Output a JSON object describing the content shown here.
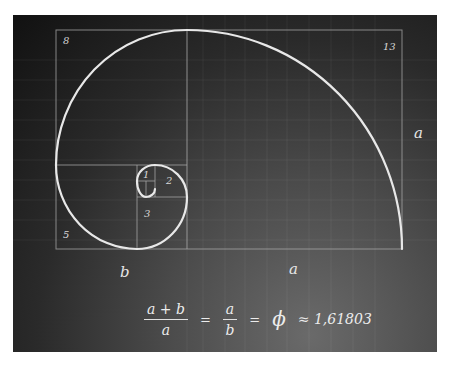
{
  "diagram": {
    "colors": {
      "background_dark": "#111111",
      "background_light": "#6a6a6a",
      "lines": "#9a9a9a",
      "spiral": "#e8e8e8",
      "text": "#e6e6e6"
    },
    "square_labels": {
      "s1": "1",
      "s2": "2",
      "s3": "3",
      "s5": "5",
      "s8": "8",
      "s13": "13"
    },
    "side_labels": {
      "bottom_left": "b",
      "bottom_right": "a",
      "right": "a"
    }
  },
  "formula": {
    "lhs_numerator": "a + b",
    "lhs_denominator": "a",
    "equals1": "=",
    "mid_numerator": "a",
    "mid_denominator": "b",
    "equals2": "=",
    "phi_symbol": "ϕ",
    "approx_text": "≈ 1,61803"
  }
}
